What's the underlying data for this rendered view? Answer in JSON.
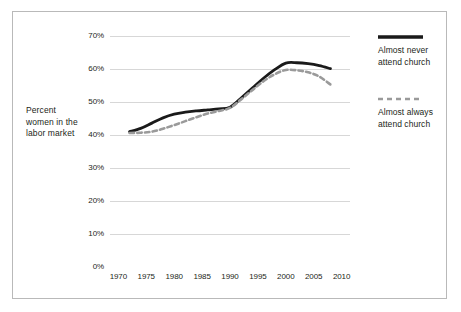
{
  "chart_data": {
    "type": "line",
    "title": "",
    "xlabel": "",
    "ylabel": "Percent women in the labor market",
    "xlim": [
      1968.5,
      2011.5
    ],
    "ylim": [
      0,
      70
    ],
    "grid": true,
    "legend_position": "right",
    "xticks": [
      "1970",
      "1975",
      "1980",
      "1985",
      "1990",
      "1995",
      "2000",
      "2005",
      "2010"
    ],
    "xtick_values": [
      1970,
      1975,
      1980,
      1985,
      1990,
      1995,
      2000,
      2005,
      2010
    ],
    "yticks": [
      "0%",
      "10%",
      "20%",
      "30%",
      "40%",
      "50%",
      "60%",
      "70%"
    ],
    "ytick_values": [
      0,
      10,
      20,
      30,
      40,
      50,
      60,
      70
    ],
    "x": [
      1972,
      1974,
      1976,
      1978,
      1980,
      1982,
      1984,
      1986,
      1988,
      1990,
      1992,
      1994,
      1996,
      1998,
      2000,
      2002,
      2004,
      2006,
      2008
    ],
    "series": [
      {
        "name": "Almost never attend church",
        "style": "solid",
        "color": "#1a1a1a",
        "values": [
          41.0,
          42.0,
          43.6,
          45.2,
          46.3,
          46.9,
          47.3,
          47.6,
          47.9,
          48.4,
          51.2,
          54.2,
          57.2,
          59.8,
          61.8,
          61.9,
          61.6,
          61.0,
          60.1
        ]
      },
      {
        "name": "Almost always attend church",
        "style": "dashed",
        "color": "#9a9a9a",
        "values": [
          40.6,
          40.7,
          41.0,
          41.9,
          43.0,
          44.2,
          45.4,
          46.5,
          47.3,
          48.2,
          50.8,
          53.6,
          56.3,
          58.4,
          59.7,
          59.6,
          59.0,
          57.7,
          55.3
        ]
      }
    ]
  },
  "legend": {
    "items": [
      {
        "label_line1": "Almost never",
        "label_line2": "attend church",
        "style": "solid"
      },
      {
        "label_line1": "Almost always",
        "label_line2": "attend church",
        "style": "dashed"
      }
    ]
  },
  "axis": {
    "y_title": "Percent women in the labor market"
  },
  "colors": {
    "solid_line": "#1a1a1a",
    "dashed_line": "#9a9a9a",
    "gridline": "#d7d7d7",
    "frame": "#b9b9b9",
    "text": "#231f20",
    "background": "#ffffff"
  }
}
